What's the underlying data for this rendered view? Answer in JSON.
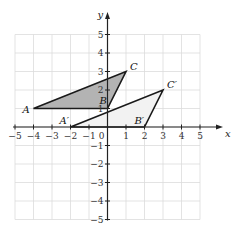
{
  "figure": {
    "x_axis_label": "x",
    "y_axis_label": "y",
    "origin_label": "0",
    "x_ticks": [
      "−5",
      "−4",
      "−3",
      "−2",
      "−1",
      "1",
      "2",
      "3",
      "4",
      "5"
    ],
    "y_ticks": [
      "5",
      "4",
      "3",
      "2",
      "1",
      "−1",
      "−2",
      "−3",
      "−4",
      "−5"
    ],
    "range": {
      "xmin": -5,
      "xmax": 5,
      "ymin": -5,
      "ymax": 5
    },
    "grid": true,
    "triangle_original": {
      "name": "ABC",
      "vertices": [
        {
          "label": "A",
          "x": -4,
          "y": 1
        },
        {
          "label": "B",
          "x": 0,
          "y": 1
        },
        {
          "label": "C",
          "x": 1,
          "y": 3
        }
      ],
      "fill": "#b3b3b3"
    },
    "triangle_image": {
      "name": "A'B'C'",
      "vertices": [
        {
          "label": "A′",
          "x": -2,
          "y": 0
        },
        {
          "label": "B′",
          "x": 2,
          "y": 0
        },
        {
          "label": "C′",
          "x": 3,
          "y": 2
        }
      ],
      "fill": "#f2f2f2"
    },
    "colors": {
      "grid": "#dcdcdc",
      "axis": "#222222",
      "edge": "#1a1a1a"
    }
  }
}
